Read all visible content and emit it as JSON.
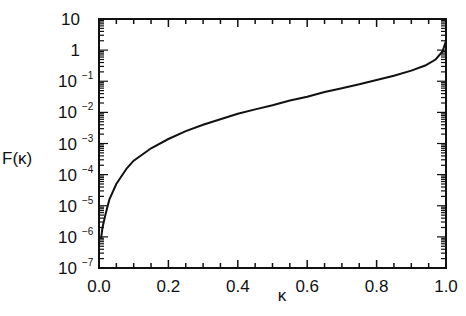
{
  "chart_data": {
    "type": "line",
    "title": "",
    "xlabel": "κ",
    "ylabel": "F(κ)",
    "xscale": "linear",
    "yscale": "log",
    "xlim": [
      0.0,
      1.0
    ],
    "ylim": [
      1e-07,
      10
    ],
    "grid": false,
    "legend": null,
    "x_ticks": [
      "0.0",
      "0.2",
      "0.4",
      "0.6",
      "0.8",
      "1.0"
    ],
    "y_ticks": [
      {
        "base": "10",
        "exp": "",
        "value": 10
      },
      {
        "base": "1",
        "exp": "",
        "value": 1
      },
      {
        "base": "10",
        "exp": "−1",
        "value": 0.1
      },
      {
        "base": "10",
        "exp": "−2",
        "value": 0.01
      },
      {
        "base": "10",
        "exp": "−3",
        "value": 0.001
      },
      {
        "base": "10",
        "exp": "−4",
        "value": 0.0001
      },
      {
        "base": "10",
        "exp": "−5",
        "value": 1e-05
      },
      {
        "base": "10",
        "exp": "−6",
        "value": 1e-06
      },
      {
        "base": "10",
        "exp": "−7",
        "value": 1e-07
      }
    ],
    "series": [
      {
        "name": "F(κ)",
        "x": [
          0.006,
          0.01,
          0.02,
          0.03,
          0.05,
          0.08,
          0.1,
          0.15,
          0.2,
          0.25,
          0.3,
          0.35,
          0.4,
          0.45,
          0.5,
          0.55,
          0.6,
          0.65,
          0.7,
          0.75,
          0.8,
          0.85,
          0.9,
          0.94,
          0.97,
          0.99,
          1.0
        ],
        "y": [
          9e-07,
          2e-06,
          6e-06,
          1.6e-05,
          5e-05,
          0.00016,
          0.00028,
          0.0007,
          0.0014,
          0.0025,
          0.004,
          0.006,
          0.009,
          0.0125,
          0.017,
          0.024,
          0.032,
          0.045,
          0.06,
          0.08,
          0.11,
          0.15,
          0.22,
          0.32,
          0.5,
          0.9,
          2.0
        ]
      }
    ]
  }
}
